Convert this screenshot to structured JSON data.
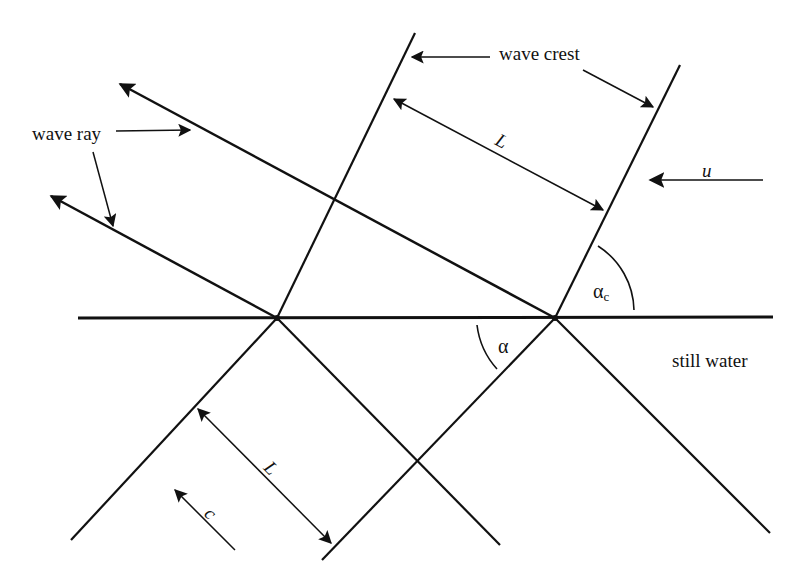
{
  "figure": {
    "labels": {
      "wave_crest": "wave crest",
      "wave_ray": "wave ray",
      "wavelength_top": "L",
      "wavelength_bottom": "L",
      "current_velocity": "u",
      "phase_speed": "c",
      "angle_incident": "α",
      "angle_current": "α",
      "angle_current_subscript": "c",
      "region_below": "still water"
    },
    "colors": {
      "ink": "#111111",
      "background": "#ffffff"
    }
  }
}
